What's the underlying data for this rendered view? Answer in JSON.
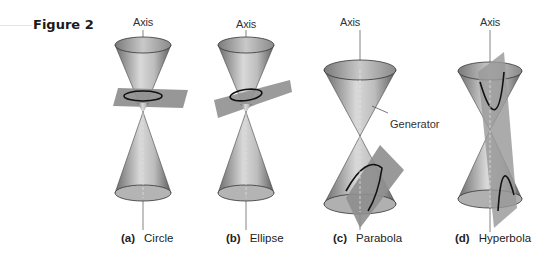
{
  "figure": {
    "label": "Figure 2",
    "axis_label": "Axis",
    "generator_label": "Generator",
    "panels": [
      {
        "id": "a",
        "letter": "(a)",
        "name": "Circle",
        "axis_x": 143
      },
      {
        "id": "b",
        "letter": "(b)",
        "name": "Ellipse",
        "axis_x": 246
      },
      {
        "id": "c",
        "letter": "(c)",
        "name": "Parabola",
        "axis_x": 350
      },
      {
        "id": "d",
        "letter": "(d)",
        "name": "Hyperbola",
        "axis_x": 490
      }
    ]
  },
  "colors": {
    "cone_dark": "#5a5a5a",
    "cone_light": "#d8d8d8",
    "plane": "#9a9a9a",
    "curve": "#111111",
    "axis": "#555555"
  }
}
